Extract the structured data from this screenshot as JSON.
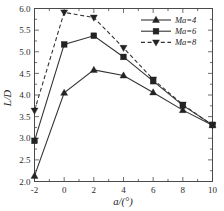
{
  "chart_data": {
    "type": "line",
    "title": "",
    "xlabel": "a/(°)",
    "ylabel": "L/D",
    "x": [
      -2,
      0,
      2,
      4,
      6,
      8,
      10
    ],
    "xlim": [
      -2,
      10
    ],
    "ylim": [
      2.0,
      6.0
    ],
    "xticks": [
      -2,
      0,
      2,
      4,
      6,
      8,
      10
    ],
    "yticks": [
      2.0,
      2.5,
      3.0,
      3.5,
      4.0,
      4.5,
      5.0,
      5.5,
      6.0
    ],
    "xtick_labels": [
      "-2",
      "0",
      "2",
      "4",
      "6",
      "8",
      "10"
    ],
    "ytick_labels": [
      "2.0",
      "2.5",
      "3.0",
      "3.5",
      "4.0",
      "4.5",
      "5.0",
      "5.5",
      "6.0"
    ],
    "grid": false,
    "minor_ticks": true,
    "legend_position": "top-right",
    "series": [
      {
        "name": "Ma=4",
        "marker": "triangle-up",
        "linestyle": "solid",
        "color": "#333333",
        "values": [
          2.13,
          4.05,
          4.58,
          4.45,
          4.06,
          3.65,
          3.3
        ]
      },
      {
        "name": "Ma=6",
        "marker": "square",
        "linestyle": "solid",
        "color": "#333333",
        "values": [
          2.94,
          5.17,
          5.37,
          4.88,
          4.32,
          3.76,
          3.31
        ]
      },
      {
        "name": "Ma=8",
        "marker": "triangle-down",
        "linestyle": "dashed",
        "color": "#333333",
        "values": [
          3.64,
          5.91,
          5.79,
          5.09,
          4.36,
          3.78,
          3.3
        ]
      }
    ]
  },
  "axes": {
    "x_title": "a/(°)",
    "y_title": "L/D"
  },
  "legend": {
    "entries": [
      {
        "label": "Ma=4"
      },
      {
        "label": "Ma=6"
      },
      {
        "label": "Ma=8"
      }
    ]
  }
}
